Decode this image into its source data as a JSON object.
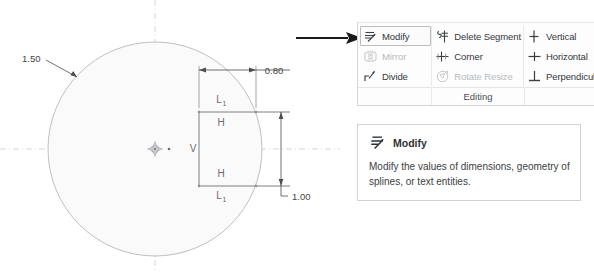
{
  "drawing": {
    "circle_dimension": "1.50",
    "width_dimension": "0.80",
    "height_dimension": "1.00",
    "constraints": {
      "top_length": "L",
      "top_length_sub": "1",
      "top_horizontal": "H",
      "bottom_horizontal": "H",
      "bottom_length": "L",
      "bottom_length_sub": "1",
      "vertical": "V"
    },
    "colors": {
      "circle_fill": "#fafafa",
      "circle_stroke": "#b6b8ba",
      "geometry_stroke": "#6e7073",
      "dimension_stroke": "#4a4c4f",
      "centerline": "#d8bcbc",
      "pointer_arrow": "#1a1a1a"
    }
  },
  "ribbon": {
    "group_label": "Editing",
    "columns": [
      {
        "name": "column-a",
        "items": [
          {
            "label": "Modify",
            "icon": "modify-icon",
            "state": "selected"
          },
          {
            "label": "Mirror",
            "icon": "mirror-icon",
            "state": "disabled"
          },
          {
            "label": "Divide",
            "icon": "divide-icon",
            "state": "enabled"
          }
        ]
      },
      {
        "name": "column-b",
        "items": [
          {
            "label": "Delete Segment",
            "icon": "delete-segment-icon",
            "state": "enabled"
          },
          {
            "label": "Corner",
            "icon": "corner-icon",
            "state": "enabled"
          },
          {
            "label": "Rotate Resize",
            "icon": "rotate-resize-icon",
            "state": "disabled"
          }
        ]
      },
      {
        "name": "column-c",
        "items": [
          {
            "label": "Vertical",
            "icon": "vertical-constraint-icon",
            "state": "enabled"
          },
          {
            "label": "Horizontal",
            "icon": "horizontal-constraint-icon",
            "state": "enabled"
          },
          {
            "label": "Perpendicular",
            "icon": "perpendicular-constraint-icon",
            "state": "enabled"
          }
        ]
      }
    ]
  },
  "tooltip": {
    "icon": "modify-icon",
    "title": "Modify",
    "body": "Modify the values of dimensions, geometry of splines, or text entities."
  }
}
